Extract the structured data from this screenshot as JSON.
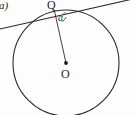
{
  "figure": {
    "part_label": "a)",
    "background_color": "#fdfdfd",
    "stroke_color": "#2b2b2b",
    "labels": {
      "tangent_point": "Q",
      "center_point": "O",
      "angle": "a",
      "angle_degree_symbol": "°"
    },
    "geometry": {
      "circle": {
        "center_x": 66,
        "center_y": 63,
        "radius": 53
      },
      "center_dot": {
        "x": 66,
        "y": 63,
        "r": 1.9
      },
      "tangent_point": {
        "x": 54.5,
        "y": 11.2
      },
      "tangent_line": {
        "x1": 0,
        "y1": 29,
        "x2": 135,
        "y2": -1.5
      },
      "radius_line": {
        "x1": 66,
        "y1": 63,
        "x2": 54.5,
        "y2": 11.2
      },
      "angle_arc_path": "M 62.2 21.7 A 12 12 0 0 0 66.2 17.0"
    }
  }
}
